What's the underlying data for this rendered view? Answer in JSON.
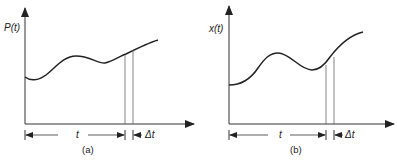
{
  "panels": [
    {
      "id": "a",
      "y_label": "P(t)",
      "x_interval_label": "t",
      "delta_label": "Δt",
      "caption": "(a)"
    },
    {
      "id": "b",
      "y_label": "x(t)",
      "x_interval_label": "t",
      "delta_label": "Δt",
      "caption": "(b)"
    }
  ],
  "colors": {
    "line": "#222222",
    "thin": "#666666"
  }
}
